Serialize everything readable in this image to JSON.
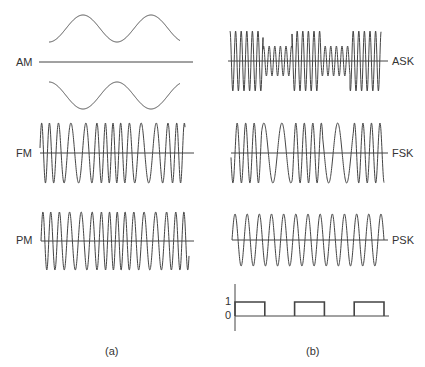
{
  "figure": {
    "panel_a": {
      "caption": "(a)",
      "signals": [
        {
          "id": "am",
          "label": "AM"
        },
        {
          "id": "fm",
          "label": "FM"
        },
        {
          "id": "pm",
          "label": "PM"
        }
      ]
    },
    "panel_b": {
      "caption": "(b)",
      "signals": [
        {
          "id": "ask",
          "label": "ASK"
        },
        {
          "id": "fsk",
          "label": "FSK"
        },
        {
          "id": "psk",
          "label": "PSK"
        }
      ],
      "digital": {
        "level_high_label": "1",
        "level_low_label": "0",
        "bits": [
          1,
          0,
          1,
          0,
          1
        ]
      }
    },
    "stroke_color": "#444444",
    "background": "#ffffff"
  }
}
